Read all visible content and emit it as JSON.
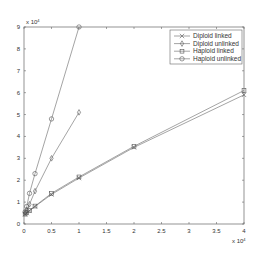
{
  "chart_data": {
    "type": "line",
    "title": "",
    "xlabel": "",
    "ylabel": "",
    "x_multiplier": "x 10^4",
    "y_multiplier": "x 10^4",
    "xlim": [
      0,
      4
    ],
    "ylim": [
      0,
      9
    ],
    "x_ticks": [
      "0",
      "0.5",
      "1",
      "1.5",
      "2",
      "2.5",
      "3",
      "3.5",
      "4"
    ],
    "y_ticks": [
      "0",
      "1",
      "2",
      "3",
      "4",
      "5",
      "6",
      "7",
      "8",
      "9"
    ],
    "grid": false,
    "legend_position": "upper right",
    "series": [
      {
        "name": "Diploid linked",
        "marker": "x",
        "x": [
          0.02,
          0.05,
          0.1,
          0.2,
          0.5,
          1,
          2,
          4
        ],
        "y": [
          0.45,
          0.5,
          0.6,
          0.8,
          1.35,
          2.1,
          3.5,
          5.9
        ]
      },
      {
        "name": "Diploid unlinked",
        "marker": "diamond",
        "x": [
          0.02,
          0.05,
          0.1,
          0.2,
          0.5,
          1
        ],
        "y": [
          0.5,
          0.65,
          0.9,
          1.5,
          3.0,
          5.1
        ]
      },
      {
        "name": "Haploid linked",
        "marker": "square",
        "x": [
          0.02,
          0.05,
          0.1,
          0.2,
          0.5,
          1,
          2,
          4
        ],
        "y": [
          0.45,
          0.52,
          0.62,
          0.82,
          1.4,
          2.15,
          3.55,
          6.1
        ]
      },
      {
        "name": "Haploid unlinked",
        "marker": "circle",
        "x": [
          0.02,
          0.05,
          0.1,
          0.2,
          0.5,
          1
        ],
        "y": [
          0.55,
          0.8,
          1.4,
          2.3,
          4.8,
          9.0
        ]
      }
    ]
  }
}
